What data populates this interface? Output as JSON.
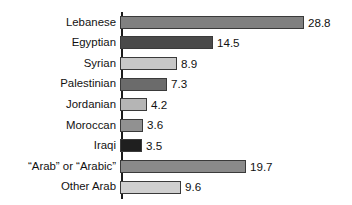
{
  "chart_data": {
    "type": "bar",
    "orientation": "horizontal",
    "title": "",
    "subtitle": "",
    "xlabel": "",
    "ylabel": "",
    "grid": false,
    "legend": false,
    "xlim": [
      0,
      28.8
    ],
    "categories": [
      "Lebanese",
      "Egyptian",
      "Syrian",
      "Palestinian",
      "Jordanian",
      "Moroccan",
      "Iraqi",
      "“Arab” or “Arabic”",
      "Other Arab"
    ],
    "values": [
      28.8,
      14.5,
      8.9,
      7.3,
      4.2,
      3.6,
      3.5,
      19.7,
      9.6
    ],
    "value_labels": [
      "28.8",
      "14.5",
      "8.9",
      "7.3",
      "4.2",
      "3.6",
      "3.5",
      "19.7",
      "9.6"
    ],
    "bar_colors": [
      "#808080",
      "#4a4a4a",
      "#c8c8c8",
      "#6b6b6b",
      "#b5b5b5",
      "#919191",
      "#1f1f1f",
      "#8a8a8a",
      "#cfcfcf"
    ],
    "bar_border_color": "#3a3a3a",
    "axis_color": "#1c1c1c",
    "text_color": "#111111",
    "background": "#ffffff"
  },
  "bars": [
    {
      "label": "Lebanese",
      "value": "28.8",
      "width": "184px",
      "color": "#808080"
    },
    {
      "label": "Egyptian",
      "value": "14.5",
      "width": "93px",
      "color": "#4a4a4a"
    },
    {
      "label": "Syrian",
      "value": "8.9",
      "width": "57px",
      "color": "#c8c8c8"
    },
    {
      "label": "Palestinian",
      "value": "7.3",
      "width": "47px",
      "color": "#6b6b6b"
    },
    {
      "label": "Jordanian",
      "value": "4.2",
      "width": "27px",
      "color": "#b5b5b5"
    },
    {
      "label": "Moroccan",
      "value": "3.6",
      "width": "23px",
      "color": "#919191"
    },
    {
      "label": "Iraqi",
      "value": "3.5",
      "width": "22px",
      "color": "#1f1f1f"
    },
    {
      "label": "“Arab” or “Arabic”",
      "value": "19.7",
      "width": "126px",
      "color": "#8a8a8a"
    },
    {
      "label": "Other Arab",
      "value": "9.6",
      "width": "61px",
      "color": "#cfcfcf"
    }
  ]
}
